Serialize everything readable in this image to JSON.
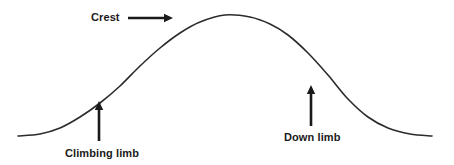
{
  "figure": {
    "type": "hydrograph-diagram",
    "background_color": "#ffffff",
    "line_color": "#2b2b2b",
    "text_color": "#1a1a1a"
  },
  "labels": {
    "crest": "Crest",
    "climbing_limb": "Climbing limb",
    "down_limb": "Down limb"
  },
  "icons": {
    "crest_arrow": "arrow-right-icon",
    "climbing_limb_arrow": "arrow-up-icon",
    "down_limb_arrow": "arrow-up-icon"
  },
  "chart_data": {
    "type": "line",
    "title": "",
    "xlabel": "",
    "ylabel": "",
    "grid": false,
    "legend": "none",
    "xlim": [
      0,
      454
    ],
    "ylim": [
      165,
      0
    ],
    "annotations": [
      {
        "name": "crest",
        "text": "Crest",
        "arrow": "right",
        "label_x": 91,
        "label_y": 11,
        "arrow_from_x": 128,
        "arrow_from_y": 18,
        "arrow_to_x": 173,
        "arrow_to_y": 18
      },
      {
        "name": "climbing-limb",
        "text": "Climbing limb",
        "arrow": "up",
        "label_x": 65,
        "label_y": 147,
        "arrow_from_x": 99,
        "arrow_from_y": 141,
        "arrow_to_x": 99,
        "arrow_to_y": 101
      },
      {
        "name": "down-limb",
        "text": "Down limb",
        "arrow": "up",
        "label_x": 284,
        "label_y": 131,
        "arrow_from_x": 311,
        "arrow_from_y": 126,
        "arrow_to_x": 311,
        "arrow_to_y": 85
      }
    ],
    "series": [
      {
        "name": "hydrograph",
        "points": [
          [
            18,
            136
          ],
          [
            40,
            134
          ],
          [
            60,
            128
          ],
          [
            80,
            117
          ],
          [
            100,
            103
          ],
          [
            120,
            86
          ],
          [
            140,
            66
          ],
          [
            160,
            48
          ],
          [
            180,
            33
          ],
          [
            200,
            22
          ],
          [
            225,
            15
          ],
          [
            250,
            17
          ],
          [
            270,
            24
          ],
          [
            288,
            35
          ],
          [
            308,
            53
          ],
          [
            328,
            75
          ],
          [
            348,
            99
          ],
          [
            368,
            117
          ],
          [
            388,
            128
          ],
          [
            410,
            134
          ],
          [
            432,
            136
          ]
        ]
      }
    ]
  }
}
